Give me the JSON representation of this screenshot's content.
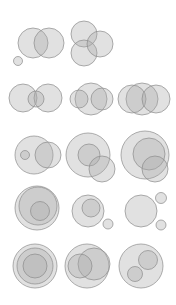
{
  "style": {
    "fill": "#a8a8a8",
    "fill_opacity": 0.35,
    "stroke": "#8c8c8c"
  },
  "diagrams": [
    {
      "id": "r1d1",
      "row": 1,
      "col": 1,
      "circles": [
        {
          "cx": 33,
          "cy": 43,
          "r": 15
        },
        {
          "cx": 49,
          "cy": 43,
          "r": 15
        },
        {
          "cx": 18,
          "cy": 61,
          "r": 4.5
        }
      ]
    },
    {
      "id": "r1d2",
      "row": 1,
      "col": 2,
      "circles": [
        {
          "cx": 84,
          "cy": 34,
          "r": 13
        },
        {
          "cx": 84,
          "cy": 53,
          "r": 13
        },
        {
          "cx": 100,
          "cy": 44,
          "r": 13
        }
      ]
    },
    {
      "id": "r2d1",
      "row": 2,
      "col": 1,
      "circles": [
        {
          "cx": 23,
          "cy": 98,
          "r": 14
        },
        {
          "cx": 48,
          "cy": 98,
          "r": 14
        },
        {
          "cx": 36,
          "cy": 99,
          "r": 8
        }
      ]
    },
    {
      "id": "r2d2",
      "row": 2,
      "col": 2,
      "circles": [
        {
          "cx": 91,
          "cy": 99,
          "r": 16
        },
        {
          "cx": 79,
          "cy": 99,
          "r": 9
        },
        {
          "cx": 102,
          "cy": 99,
          "r": 11
        }
      ]
    },
    {
      "id": "r2d3",
      "row": 2,
      "col": 3,
      "circles": [
        {
          "cx": 142,
          "cy": 99,
          "r": 16
        },
        {
          "cx": 132,
          "cy": 99,
          "r": 14
        },
        {
          "cx": 156,
          "cy": 99,
          "r": 14
        }
      ]
    },
    {
      "id": "r3d1",
      "row": 3,
      "col": 1,
      "circles": [
        {
          "cx": 34,
          "cy": 155,
          "r": 19
        },
        {
          "cx": 48,
          "cy": 155,
          "r": 13
        },
        {
          "cx": 25,
          "cy": 155,
          "r": 4.5
        }
      ]
    },
    {
      "id": "r3d2",
      "row": 3,
      "col": 2,
      "circles": [
        {
          "cx": 88,
          "cy": 155,
          "r": 22
        },
        {
          "cx": 89,
          "cy": 155,
          "r": 11
        },
        {
          "cx": 102,
          "cy": 169,
          "r": 13
        }
      ]
    },
    {
      "id": "r3d3",
      "row": 3,
      "col": 3,
      "circles": [
        {
          "cx": 145,
          "cy": 155,
          "r": 24
        },
        {
          "cx": 149,
          "cy": 154,
          "r": 16
        },
        {
          "cx": 155,
          "cy": 169,
          "r": 13
        }
      ]
    },
    {
      "id": "r4d1",
      "row": 4,
      "col": 1,
      "circles": [
        {
          "cx": 37,
          "cy": 208,
          "r": 22
        },
        {
          "cx": 38,
          "cy": 206,
          "r": 19
        },
        {
          "cx": 40,
          "cy": 211,
          "r": 9.5
        }
      ]
    },
    {
      "id": "r4d2",
      "row": 4,
      "col": 2,
      "circles": [
        {
          "cx": 88,
          "cy": 211,
          "r": 16
        },
        {
          "cx": 91,
          "cy": 208,
          "r": 9
        },
        {
          "cx": 108,
          "cy": 224,
          "r": 5
        }
      ]
    },
    {
      "id": "r4d3",
      "row": 4,
      "col": 3,
      "circles": [
        {
          "cx": 141,
          "cy": 211,
          "r": 16
        },
        {
          "cx": 161,
          "cy": 198,
          "r": 5.5
        },
        {
          "cx": 161,
          "cy": 225,
          "r": 5
        }
      ]
    },
    {
      "id": "r5d1",
      "row": 5,
      "col": 1,
      "circles": [
        {
          "cx": 35,
          "cy": 266,
          "r": 22
        },
        {
          "cx": 35,
          "cy": 266,
          "r": 18
        },
        {
          "cx": 35,
          "cy": 266,
          "r": 12
        }
      ]
    },
    {
      "id": "r5d2",
      "row": 5,
      "col": 2,
      "circles": [
        {
          "cx": 87,
          "cy": 266,
          "r": 22
        },
        {
          "cx": 94,
          "cy": 264,
          "r": 16
        },
        {
          "cx": 80,
          "cy": 266,
          "r": 12
        }
      ]
    },
    {
      "id": "r5d3",
      "row": 5,
      "col": 3,
      "circles": [
        {
          "cx": 141,
          "cy": 266,
          "r": 22
        },
        {
          "cx": 148,
          "cy": 260,
          "r": 9.5
        },
        {
          "cx": 135,
          "cy": 274,
          "r": 7.5
        }
      ]
    }
  ]
}
